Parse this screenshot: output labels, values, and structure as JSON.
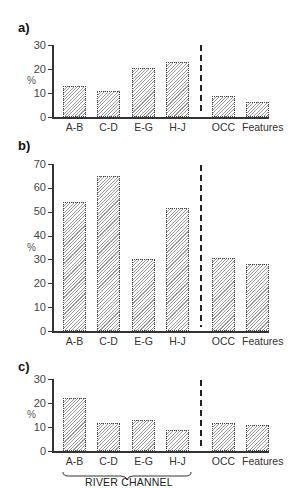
{
  "chart_data": [
    {
      "panel": "a)",
      "type": "bar",
      "ylabel": "%",
      "ylim": [
        0,
        30
      ],
      "yticks": [
        0,
        10,
        20,
        30
      ],
      "categories": [
        "A-B",
        "C-D",
        "E-G",
        "H-J",
        "OCC",
        "Features"
      ],
      "values": [
        13,
        10.7,
        20.4,
        23,
        8.9,
        6.4
      ],
      "grid": false,
      "separator_after": "H-J"
    },
    {
      "panel": "b)",
      "type": "bar",
      "ylabel": "%",
      "ylim": [
        0,
        70
      ],
      "yticks": [
        0,
        10,
        20,
        30,
        40,
        50,
        60,
        70
      ],
      "categories": [
        "A-B",
        "C-D",
        "E-G",
        "H-J",
        "OCC",
        "Features"
      ],
      "values": [
        54,
        65,
        30,
        51.5,
        30.5,
        28
      ],
      "grid": false,
      "separator_after": "H-J"
    },
    {
      "panel": "c)",
      "type": "bar",
      "ylabel": "%",
      "ylim": [
        0,
        30
      ],
      "yticks": [
        0,
        10,
        20,
        30
      ],
      "categories": [
        "A-B",
        "C-D",
        "E-G",
        "H-J",
        "OCC",
        "Features"
      ],
      "values": [
        22.2,
        11.5,
        13.1,
        8.8,
        11.7,
        11
      ],
      "grid": false,
      "separator_after": "H-J",
      "group_annotation": {
        "label": "RIVER CHANNEL",
        "spans": [
          "A-B",
          "C-D",
          "E-G",
          "H-J"
        ]
      }
    }
  ]
}
